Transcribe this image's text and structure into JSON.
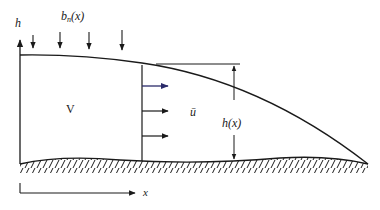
{
  "diagram": {
    "labels": {
      "h_axis": "h",
      "b_n_base": "b",
      "b_n_sub": "n",
      "b_n_arg": "(x)",
      "volume": "V",
      "mean_velocity": "ū",
      "thickness": "h(x)",
      "x_axis": "x"
    },
    "colors": {
      "line": "#1a1a1a",
      "velocity_arrow_top": "#2a2a6a",
      "background": "#ffffff"
    },
    "elements": {
      "accumulation_arrows_count": 4,
      "velocity_arrows_count": 3
    }
  }
}
